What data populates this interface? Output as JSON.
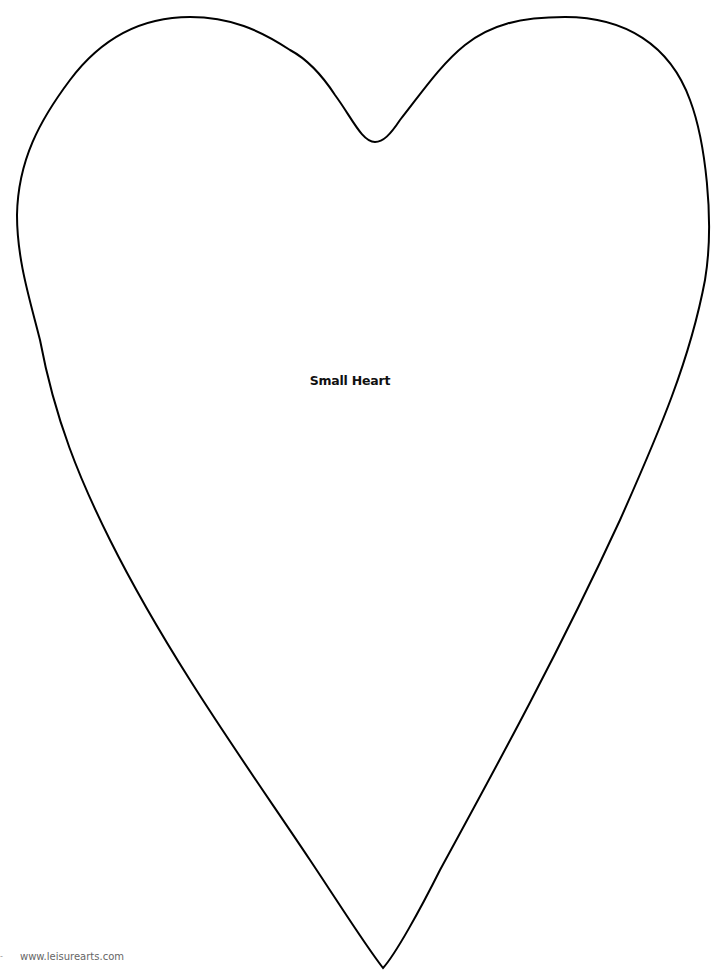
{
  "page": {
    "label": "Small Heart",
    "footer_url": "www.leisurearts.com",
    "outline_color": "#000000",
    "background": "#ffffff"
  }
}
